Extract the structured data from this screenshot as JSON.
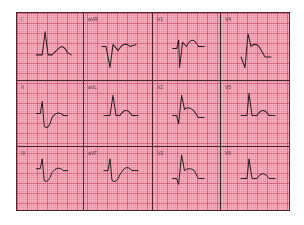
{
  "figure": {
    "type": "12-lead ECG",
    "layout": "3 rows x 4 columns",
    "colors": {
      "paper": "#f4b8c4",
      "major_grid": "#c83c5a",
      "minor_grid": "#eb8ca0",
      "trace": "#2b1a1f",
      "divider": "#4a2a30"
    }
  },
  "leads": [
    {
      "label": "I",
      "row": 0,
      "col": 0,
      "path": "M20 40 L26 40 L29 18 L32 40 L36 40 Q40 36 44 33 Q48 30 52 38 L56 40"
    },
    {
      "label": "aVR",
      "row": 0,
      "col": 1,
      "path": "M18 32 L22 32 L26 52 L29 30 L34 36 Q40 26 46 32 L52 30"
    },
    {
      "label": "V1",
      "row": 0,
      "col": 2,
      "path": "M20 34 L24 34 L26 26 L27 52 L30 28 L34 32 Q40 20 46 32 L52 32"
    },
    {
      "label": "V4",
      "row": 0,
      "col": 3,
      "path": "M20 42 L24 52 L27 20 L30 32 Q34 28 38 32 L44 42 L50 42"
    },
    {
      "label": "II",
      "row": 1,
      "col": 0,
      "path": "M20 32 L24 32 L26 20 L28 44 Q32 50 36 36 Q42 28 48 34 L52 34"
    },
    {
      "label": "aVL",
      "row": 1,
      "col": 1,
      "path": "M20 34 L26 34 L29 14 L32 34 L36 34 Q42 24 48 34 L54 34"
    },
    {
      "label": "V2",
      "row": 1,
      "col": 2,
      "path": "M20 34 L24 34 L26 42 L29 14 L32 28 Q36 24 42 30 L46 36 L52 36"
    },
    {
      "label": "V5",
      "row": 1,
      "col": 3,
      "path": "M20 34 L26 34 L28 12 L31 34 L36 34 Q42 24 48 34 L54 34"
    },
    {
      "label": "III",
      "row": 2,
      "col": 0,
      "path": "M20 22 L24 22 L26 12 L28 34 Q32 38 36 26 Q42 18 48 24 L52 24"
    },
    {
      "label": "aVF",
      "row": 2,
      "col": 1,
      "path": "M20 24 L24 24 L26 12 L28 34 Q32 38 36 28 Q42 16 48 24 L54 24"
    },
    {
      "label": "V3",
      "row": 2,
      "col": 2,
      "path": "M20 32 L24 32 L26 38 L29 8 L32 24 Q36 20 42 24 L46 32 L52 32"
    },
    {
      "label": "V6",
      "row": 2,
      "col": 3,
      "path": "M20 32 L26 32 L28 12 L31 32 L36 32 Q42 22 48 32 L54 32"
    }
  ]
}
